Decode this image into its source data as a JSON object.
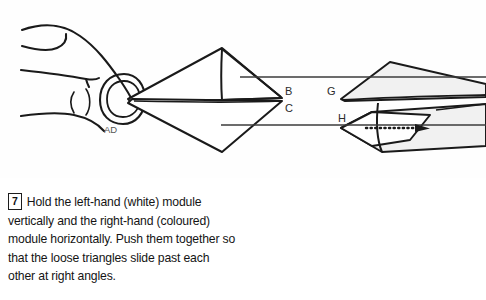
{
  "page": {
    "background_color": "#fdfdfd",
    "width": 486,
    "height": 300
  },
  "figure": {
    "name": "origami-assembly-step-diagram",
    "description_alt": "Line drawing of a hand holding a white paper module on the left being pushed into a coloured module on the right",
    "ink_color": "#1a1a1a",
    "module_fill_white": "#ffffff",
    "module_fill_coloured": "#f1f1f1",
    "labels": [
      {
        "id": "label-ad",
        "text": "AD",
        "x": 104,
        "y": 133
      },
      {
        "id": "label-b",
        "text": "B",
        "x": 285,
        "y": 95
      },
      {
        "id": "label-c",
        "text": "C",
        "x": 285,
        "y": 112
      },
      {
        "id": "label-g",
        "text": "G",
        "x": 327,
        "y": 95
      },
      {
        "id": "label-h",
        "text": "H",
        "x": 338,
        "y": 122
      }
    ],
    "leader_lines": [
      {
        "id": "leader-b",
        "x1": 240,
        "y1": 77,
        "x2": 333,
        "y2": 77
      },
      {
        "id": "leader-c",
        "x1": 221,
        "y1": 125,
        "x2": 341,
        "y2": 125
      },
      {
        "id": "leader-g",
        "x1": 333,
        "y1": 77,
        "x2": 486,
        "y2": 77
      },
      {
        "id": "leader-h",
        "x1": 341,
        "y1": 125,
        "x2": 486,
        "y2": 125
      }
    ],
    "motion_arrow": {
      "id": "push-direction-arrow",
      "style": "dotted",
      "x1": 368,
      "y1": 128,
      "x2": 428,
      "y2": 128,
      "points": "right"
    }
  },
  "caption": {
    "step_number": "7",
    "text": "Hold the left-hand (white) module vertically and the right-hand (coloured) module horizontally. Push them together so that the loose triangles slide past each other at right angles."
  }
}
